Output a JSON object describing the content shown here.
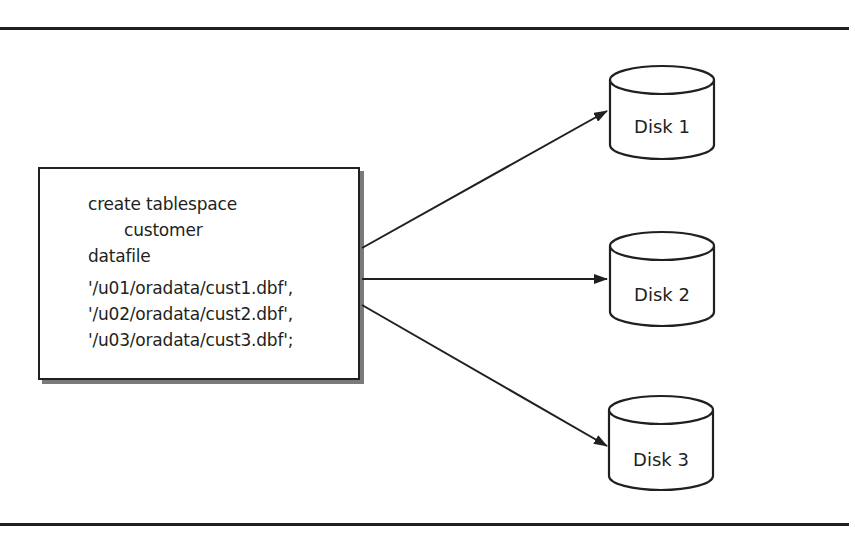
{
  "diagram": {
    "type": "tablespace-to-datafiles",
    "source_box": {
      "lines": [
        "create tablespace",
        "customer",
        "datafile",
        "'/u01/oradata/cust1.dbf',",
        "'/u02/oradata/cust2.dbf',",
        "'/u03/oradata/cust3.dbf';"
      ]
    },
    "disks": [
      {
        "label": "Disk 1",
        "icon": "disk-cylinder-icon"
      },
      {
        "label": "Disk 2",
        "icon": "disk-cylinder-icon"
      },
      {
        "label": "Disk 3",
        "icon": "disk-cylinder-icon"
      }
    ],
    "edges": [
      {
        "from": "source_box",
        "to": "Disk 1"
      },
      {
        "from": "source_box",
        "to": "Disk 2"
      },
      {
        "from": "source_box",
        "to": "Disk 3"
      }
    ],
    "colors": {
      "stroke": "#231f20",
      "shadow": "#7a7a7a",
      "background": "#ffffff"
    }
  }
}
